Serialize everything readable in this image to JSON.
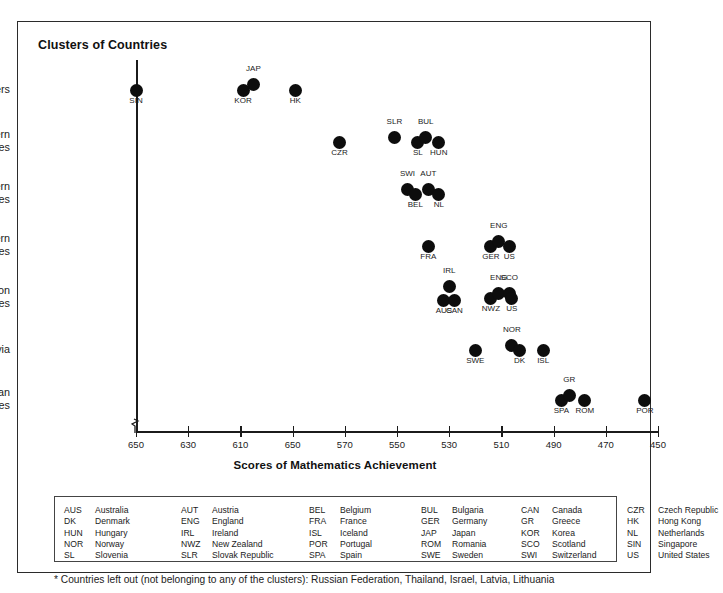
{
  "figure": {
    "title": "Clusters of Countries",
    "footnote": "* Countries left out (not belonging to any of the clusters): Russian Federation, Thailand, Israel, Latvia, Lithuania"
  },
  "chart_data": {
    "type": "scatter",
    "title": "Clusters of Countries",
    "xlabel": "Scores of Mathematics Achievement",
    "ylabel": "",
    "grid": false,
    "legend": "none",
    "xlim": [
      655,
      450
    ],
    "x_axis_reversed": true,
    "xticks": [
      650,
      630,
      610,
      650,
      570,
      550,
      530,
      510,
      490,
      470,
      450
    ],
    "xtick_labels": [
      "650",
      "630",
      "610",
      "650",
      "570",
      "550",
      "530",
      "510",
      "490",
      "470",
      "450"
    ],
    "xtick_note": "The 4th tick is printed as 650 in the source figure (expected 590).",
    "categories": [
      "Asian Pacific Tigers",
      "Small Eastern European Countries",
      "Small Western European Countries",
      "Large Western Economies",
      "Anglo-Saxon Countries",
      "Scandinavia",
      "Southern European Countries"
    ],
    "points": [
      {
        "cluster": "Asian Pacific Tigers",
        "code": "SIN",
        "x": 650,
        "label_pos": "below"
      },
      {
        "cluster": "Asian Pacific Tigers",
        "code": "KOR",
        "x": 609,
        "label_pos": "below"
      },
      {
        "cluster": "Asian Pacific Tigers",
        "code": "JAP",
        "x": 605,
        "label_pos": "above"
      },
      {
        "cluster": "Asian Pacific Tigers",
        "code": "HK",
        "x": 589,
        "label_pos": "below"
      },
      {
        "cluster": "Small Eastern European Countries",
        "code": "CZR",
        "x": 572,
        "label_pos": "below"
      },
      {
        "cluster": "Small Eastern European Countries",
        "code": "SLR",
        "x": 551,
        "label_pos": "above"
      },
      {
        "cluster": "Small Eastern European Countries",
        "code": "SL",
        "x": 542,
        "label_pos": "below"
      },
      {
        "cluster": "Small Eastern European Countries",
        "code": "BUL",
        "x": 539,
        "label_pos": "above"
      },
      {
        "cluster": "Small Eastern European Countries",
        "code": "HUN",
        "x": 534,
        "label_pos": "below"
      },
      {
        "cluster": "Small Western European Countries",
        "code": "SWI",
        "x": 546,
        "label_pos": "above"
      },
      {
        "cluster": "Small Western European Countries",
        "code": "BEL",
        "x": 543,
        "label_pos": "below"
      },
      {
        "cluster": "Small Western European Countries",
        "code": "AUT",
        "x": 538,
        "label_pos": "above"
      },
      {
        "cluster": "Small Western European Countries",
        "code": "NL",
        "x": 534,
        "label_pos": "below"
      },
      {
        "cluster": "Large Western Economies",
        "code": "FRA",
        "x": 538,
        "label_pos": "below"
      },
      {
        "cluster": "Large Western Economies",
        "code": "GER",
        "x": 514,
        "label_pos": "below"
      },
      {
        "cluster": "Large Western Economies",
        "code": "ENG",
        "x": 511,
        "label_pos": "above"
      },
      {
        "cluster": "Large Western Economies",
        "code": "US",
        "x": 507,
        "label_pos": "below"
      },
      {
        "cluster": "Anglo-Saxon Countries",
        "code": "IRL",
        "x": 530,
        "label_pos": "above"
      },
      {
        "cluster": "Anglo-Saxon Countries",
        "code": "AUS",
        "x": 532,
        "label_pos": "below"
      },
      {
        "cluster": "Anglo-Saxon Countries",
        "code": "CAN",
        "x": 528,
        "label_pos": "below"
      },
      {
        "cluster": "Anglo-Saxon Countries",
        "code": "NWZ",
        "x": 514,
        "label_pos": "below"
      },
      {
        "cluster": "Anglo-Saxon Countries",
        "code": "ENG",
        "x": 511,
        "label_pos": "above"
      },
      {
        "cluster": "Anglo-Saxon Countries",
        "code": "SCO",
        "x": 507,
        "label_pos": "above"
      },
      {
        "cluster": "Anglo-Saxon Countries",
        "code": "US",
        "x": 506,
        "label_pos": "below"
      },
      {
        "cluster": "Scandinavia",
        "code": "SWE",
        "x": 520,
        "label_pos": "below"
      },
      {
        "cluster": "Scandinavia",
        "code": "NOR",
        "x": 506,
        "label_pos": "above"
      },
      {
        "cluster": "Scandinavia",
        "code": "DK",
        "x": 503,
        "label_pos": "below"
      },
      {
        "cluster": "Scandinavia",
        "code": "ISL",
        "x": 494,
        "label_pos": "below"
      },
      {
        "cluster": "Southern European Countries",
        "code": "SPA",
        "x": 487,
        "label_pos": "below"
      },
      {
        "cluster": "Southern European Countries",
        "code": "GR",
        "x": 484,
        "label_pos": "above"
      },
      {
        "cluster": "Southern European Countries",
        "code": "ROM",
        "x": 478,
        "label_pos": "below"
      },
      {
        "cluster": "Southern European Countries",
        "code": "POR",
        "x": 455,
        "label_pos": "below"
      }
    ]
  },
  "legend": {
    "columns": [
      [
        {
          "code": "AUS",
          "name": "Australia"
        },
        {
          "code": "DK",
          "name": "Denmark"
        },
        {
          "code": "HUN",
          "name": "Hungary"
        },
        {
          "code": "NOR",
          "name": "Norway"
        },
        {
          "code": "SL",
          "name": "Slovenia"
        }
      ],
      [
        {
          "code": "AUT",
          "name": "Austria"
        },
        {
          "code": "ENG",
          "name": "England"
        },
        {
          "code": "IRL",
          "name": "Ireland"
        },
        {
          "code": "NWZ",
          "name": "New Zealand"
        },
        {
          "code": "SLR",
          "name": "Slovak Republic"
        }
      ],
      [
        {
          "code": "BEL",
          "name": "Belgium"
        },
        {
          "code": "FRA",
          "name": "France"
        },
        {
          "code": "ISL",
          "name": "Iceland"
        },
        {
          "code": "POR",
          "name": "Portugal"
        },
        {
          "code": "SPA",
          "name": "Spain"
        }
      ],
      [
        {
          "code": "BUL",
          "name": "Bulgaria"
        },
        {
          "code": "GER",
          "name": "Germany"
        },
        {
          "code": "JAP",
          "name": "Japan"
        },
        {
          "code": "ROM",
          "name": "Romania"
        },
        {
          "code": "SWE",
          "name": "Sweden"
        }
      ],
      [
        {
          "code": "CAN",
          "name": "Canada"
        },
        {
          "code": "GR",
          "name": "Greece"
        },
        {
          "code": "KOR",
          "name": "Korea"
        },
        {
          "code": "SCO",
          "name": "Scotland"
        },
        {
          "code": "SWI",
          "name": "Switzerland"
        }
      ],
      [
        {
          "code": "CZR",
          "name": "Czech Republic"
        },
        {
          "code": "HK",
          "name": "Hong Kong"
        },
        {
          "code": "NL",
          "name": "Netherlands"
        },
        {
          "code": "SIN",
          "name": "Singapore"
        },
        {
          "code": "US",
          "name": "United States"
        }
      ]
    ]
  }
}
